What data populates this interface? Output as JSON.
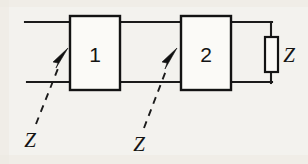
{
  "figure": {
    "kind": "circuit-diagram",
    "background_color": "#f3f2ee",
    "line_color": "#1b1b1b"
  },
  "blocks": [
    {
      "id": "block-1",
      "label": "1",
      "x": 70,
      "y": 16,
      "width": 50,
      "height": 74
    },
    {
      "id": "block-2",
      "label": "2",
      "x": 181,
      "y": 16,
      "width": 50,
      "height": 74
    }
  ],
  "termination": {
    "id": "impedance-z",
    "label": "Z",
    "symbol": "rectangular-impedance",
    "x": 265,
    "y": 37,
    "width": 13,
    "height": 35,
    "label_x": 288,
    "label_y": 55
  },
  "wires": {
    "top_y": 22,
    "bottom_y": 82,
    "left_start_x": 25,
    "right_node_x": 271,
    "segments": [
      {
        "name": "top-input-lead",
        "x1": 25,
        "y1": 22,
        "x2": 70,
        "y2": 22
      },
      {
        "name": "bottom-input-lead",
        "x1": 27,
        "y1": 82,
        "x2": 70,
        "y2": 82
      },
      {
        "name": "top-interstage",
        "x1": 120,
        "y1": 22,
        "x2": 181,
        "y2": 22
      },
      {
        "name": "bottom-interstage",
        "x1": 120,
        "y1": 82,
        "x2": 181,
        "y2": 82
      },
      {
        "name": "top-output-lead",
        "x1": 231,
        "y1": 22,
        "x2": 271,
        "y2": 22
      },
      {
        "name": "bottom-output-lead",
        "x1": 231,
        "y1": 82,
        "x2": 271,
        "y2": 82
      },
      {
        "name": "impedance-top-leg",
        "x1": 271,
        "y1": 22,
        "x2": 271,
        "y2": 37
      },
      {
        "name": "impedance-bottom-leg",
        "x1": 271,
        "y1": 72,
        "x2": 271,
        "y2": 82
      }
    ]
  },
  "annotations": [
    {
      "id": "annotation-z-1",
      "label": "Z",
      "label_x": 29,
      "label_y": 139,
      "leader": {
        "x1": 36,
        "y1": 124,
        "x2": 59,
        "y2": 66
      },
      "arrow_tip": {
        "x": 66,
        "y": 50
      },
      "arrow_angle_deg": -68
    },
    {
      "id": "annotation-z-2",
      "label": "Z",
      "label_x": 138,
      "label_y": 143,
      "leader": {
        "x1": 144,
        "y1": 128,
        "x2": 167,
        "y2": 68
      },
      "arrow_tip": {
        "x": 175,
        "y": 50
      },
      "arrow_angle_deg": -68
    }
  ]
}
